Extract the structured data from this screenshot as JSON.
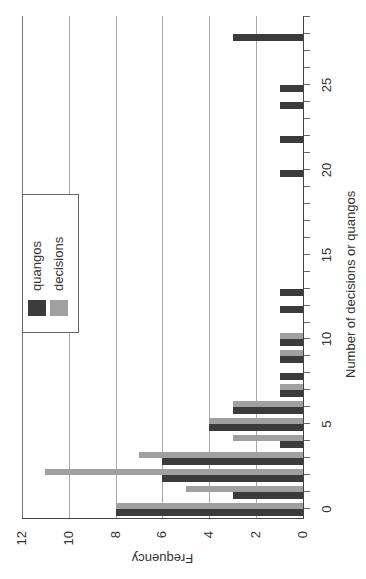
{
  "chart_data": {
    "type": "bar",
    "orientation_note": "figure is rotated 90 degrees counter-clockwise on the page",
    "title": "",
    "xlabel": "Number of decisions or quangos",
    "ylabel": "Frequency",
    "categories": [
      0,
      1,
      2,
      3,
      4,
      5,
      6,
      7,
      8,
      9,
      10,
      11,
      12,
      13,
      14,
      15,
      16,
      17,
      18,
      19,
      20,
      21,
      22,
      23,
      24,
      25,
      26,
      27,
      28
    ],
    "series": [
      {
        "name": "quangos",
        "color": "#3b3b3b",
        "values": [
          8,
          3,
          6,
          6,
          1,
          4,
          3,
          1,
          1,
          1,
          1,
          0,
          1,
          1,
          0,
          0,
          0,
          0,
          0,
          0,
          1,
          0,
          1,
          0,
          1,
          1,
          0,
          0,
          3
        ]
      },
      {
        "name": "decisions",
        "color": "#a0a0a0",
        "values": [
          8,
          5,
          11,
          7,
          3,
          4,
          3,
          1,
          0,
          1,
          1,
          0,
          0,
          0,
          0,
          0,
          0,
          0,
          0,
          0,
          0,
          0,
          0,
          0,
          0,
          0,
          0,
          0,
          0
        ]
      }
    ],
    "ylim": [
      0,
      12
    ],
    "yticks": [
      0,
      2,
      4,
      6,
      8,
      10,
      12
    ],
    "xticks_labeled": [
      0,
      5,
      10,
      15,
      20,
      25
    ],
    "grid": "horizontal gridlines at y ticks",
    "legend": {
      "position": "upper middle",
      "entries": [
        "quangos",
        "decisions"
      ]
    }
  },
  "labels": {
    "xlabel": "Number of decisions or quangos",
    "ylabel": "Frequency",
    "legend_quangos": "quangos",
    "legend_decisions": "decisions"
  }
}
